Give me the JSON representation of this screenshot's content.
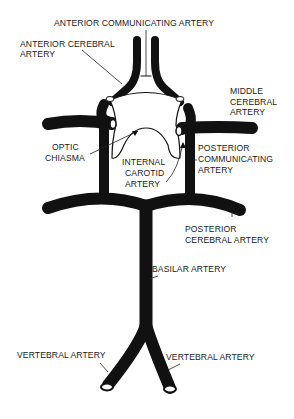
{
  "diagram": {
    "labels": {
      "anterior_communicating": "ANTERIOR COMMUNICATING ARTERY",
      "anterior_cerebral_1": "ANTERIOR CEREBRAL",
      "anterior_cerebral_2": "ARTERY",
      "middle_cerebral_1": "MIDDLE",
      "middle_cerebral_2": "CEREBRAL",
      "middle_cerebral_3": "ARTERY",
      "optic_chiasma_1": "OPTIC",
      "optic_chiasma_2": "CHIASMA",
      "internal_carotid_1": "INTERNAL",
      "internal_carotid_2": "CAROTID",
      "internal_carotid_3": "ARTERY",
      "posterior_communicating_1": "POSTERIOR",
      "posterior_communicating_2": "COMMUNICATING",
      "posterior_communicating_3": "ARTERY",
      "posterior_cerebral_1": "POSTERIOR",
      "posterior_cerebral_2": "CEREBRAL ARTERY",
      "basilar": "BASILAR ARTERY",
      "vertebral_left": "VERTEBRAL ARTERY",
      "vertebral_right": "VERTEBRAL ARTERY"
    },
    "colors": {
      "artery": "#111111",
      "background": "#ffffff",
      "leader_line": "#222222"
    }
  }
}
